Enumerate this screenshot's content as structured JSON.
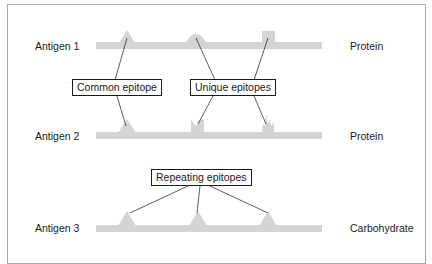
{
  "diagram": {
    "colors": {
      "backbone": "#d4d4d4",
      "connector": "#333333",
      "frame": "#a9a9a9",
      "text": "#1a1a1a"
    },
    "antigens": [
      {
        "label": "Antigen 1",
        "type": "Protein",
        "epitopes": [
          {
            "shape": "triangle",
            "group": "common"
          },
          {
            "shape": "semicircle",
            "group": "unique"
          },
          {
            "shape": "square",
            "group": "unique"
          }
        ]
      },
      {
        "label": "Antigen 2",
        "type": "Protein",
        "epitopes": [
          {
            "shape": "triangle",
            "group": "common"
          },
          {
            "shape": "notched-block",
            "group": "unique"
          },
          {
            "shape": "spiky",
            "group": "unique"
          }
        ]
      },
      {
        "label": "Antigen 3",
        "type": "Carbohydrate",
        "epitopes": [
          {
            "shape": "triangle",
            "group": "repeating"
          },
          {
            "shape": "triangle",
            "group": "repeating"
          },
          {
            "shape": "triangle",
            "group": "repeating"
          }
        ]
      }
    ],
    "callouts": {
      "common": "Common epitope",
      "unique": "Unique epitopes",
      "repeating": "Repeating epitopes"
    }
  }
}
